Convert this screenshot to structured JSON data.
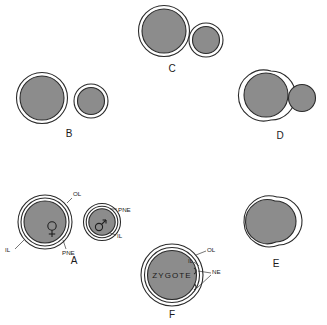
{
  "figure": {
    "background_color": "#ffffff",
    "cell_fill_color": "#8c8c8c",
    "outline_color": "#2b2b2b"
  },
  "panels": [
    {
      "id": "A",
      "letter": "A",
      "description": "Female and male pronuclei separate, each with outer layer, inner layer and pronuclear envelope",
      "annotations": [
        {
          "text": "OL",
          "name": "label-ol-a"
        },
        {
          "text": "IL",
          "name": "label-il-a"
        },
        {
          "text": "PNE",
          "name": "label-pne-a-female"
        },
        {
          "text": "PNE",
          "name": "label-pne-a-male"
        },
        {
          "text": "IL",
          "name": "label-il-a-male"
        }
      ],
      "symbols": [
        {
          "glyph": "female",
          "name": "female-pronucleus-symbol"
        },
        {
          "glyph": "male",
          "name": "male-pronucleus-symbol"
        }
      ]
    },
    {
      "id": "B",
      "letter": "B",
      "description": "Two separate double-membraned pronuclei approaching",
      "annotations": [],
      "symbols": []
    },
    {
      "id": "C",
      "letter": "C",
      "description": "Pronuclei in contact, outer layers touching",
      "annotations": [],
      "symbols": []
    },
    {
      "id": "D",
      "letter": "D",
      "description": "Outer layers fused, inner layers in contact",
      "annotations": [],
      "symbols": []
    },
    {
      "id": "E",
      "letter": "E",
      "description": "Membranes merging into a single envelope",
      "annotations": [],
      "symbols": []
    },
    {
      "id": "F",
      "letter": "F",
      "description": "Completed zygote nucleus with single envelope",
      "center_label": "ZYGOTE",
      "annotations": [
        {
          "text": "OL",
          "name": "label-ol-f"
        },
        {
          "text": "IL",
          "name": "label-il-f"
        },
        {
          "text": "NE",
          "name": "label-ne-f"
        }
      ],
      "symbols": []
    }
  ],
  "legend_terms": {
    "OL": "OL",
    "IL": "IL",
    "PNE": "PNE",
    "NE": "NE",
    "ZYGOTE": "ZYGOTE"
  }
}
